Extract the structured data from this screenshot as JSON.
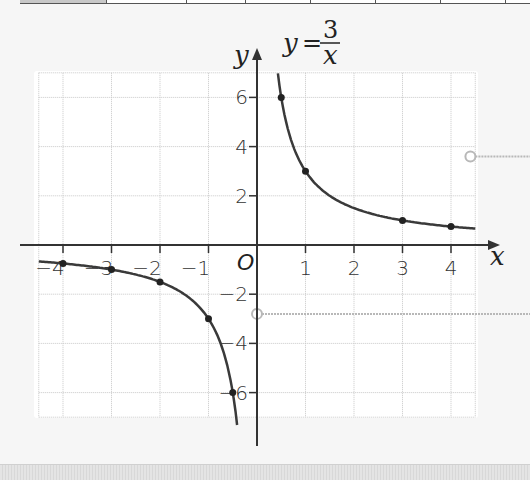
{
  "chart_data": {
    "type": "line",
    "equation": {
      "lhs": "y",
      "eq": "=",
      "numerator": "3",
      "denominator": "x"
    },
    "xlabel": "x",
    "ylabel": "y",
    "origin_label": "O",
    "xlim": [
      -4.5,
      4.5
    ],
    "ylim": [
      -7,
      7
    ],
    "grid": true,
    "x_ticks": [
      {
        "value": -4,
        "label": "-4"
      },
      {
        "value": -3,
        "label": "-3"
      },
      {
        "value": -2,
        "label": "-2"
      },
      {
        "value": -1,
        "label": "-1"
      },
      {
        "value": 1,
        "label": "1"
      },
      {
        "value": 2,
        "label": "2"
      },
      {
        "value": 3,
        "label": "3"
      },
      {
        "value": 4,
        "label": "4"
      }
    ],
    "y_ticks": [
      {
        "value": 6,
        "label": "6"
      },
      {
        "value": 4,
        "label": "4"
      },
      {
        "value": 2,
        "label": "2"
      },
      {
        "value": -2,
        "label": "-2"
      },
      {
        "value": -4,
        "label": "-4"
      },
      {
        "value": -6,
        "label": "-6"
      }
    ],
    "series": [
      {
        "name": "y = 3/x (x > 0)",
        "points": [
          [
            0.5,
            6
          ],
          [
            1,
            3
          ],
          [
            3,
            1
          ],
          [
            4,
            0.75
          ]
        ]
      },
      {
        "name": "y = 3/x (x < 0)",
        "points": [
          [
            -0.5,
            -6
          ],
          [
            -1,
            -3
          ],
          [
            -2,
            -1.5
          ],
          [
            -3,
            -1
          ],
          [
            -4,
            -0.75
          ]
        ]
      }
    ],
    "callouts": [
      {
        "anchor": [
          4.4,
          3.6
        ],
        "label": ""
      },
      {
        "anchor": [
          0,
          -2.8
        ],
        "label": ""
      }
    ]
  },
  "colors": {
    "curve": "#3a3a3a",
    "axis": "#333333",
    "grid": "#c8c8c8",
    "plot_bg": "#ffffff",
    "page_bg": "#f6f6f6",
    "callout": "#b8b8b8"
  }
}
